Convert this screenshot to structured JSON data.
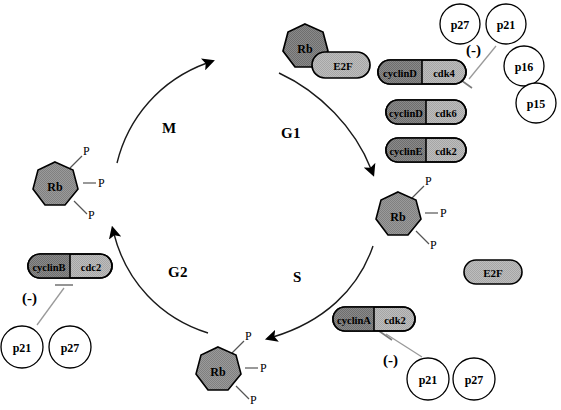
{
  "diagram": {
    "phases": [
      {
        "id": "m",
        "label": "M",
        "x": 162,
        "y": 120
      },
      {
        "id": "g1",
        "label": "G1",
        "x": 281,
        "y": 125
      },
      {
        "id": "g2",
        "label": "G2",
        "x": 168,
        "y": 264
      },
      {
        "id": "s",
        "label": "S",
        "x": 293,
        "y": 269
      }
    ],
    "colors": {
      "rb_fill": "#808080",
      "e2f_fill": "#a8a8a8",
      "cyclin_fill": "#8c8c8c",
      "cdk_fill": "#b0b0b0",
      "stroke": "#000000",
      "inhibitor_line": "#9a9a9a",
      "background": "#ffffff"
    },
    "rb_e2f_complex": {
      "rb_label": "Rb",
      "e2f_label": "E2F",
      "x": 305,
      "y": 44
    },
    "free_e2f": {
      "label": "E2F",
      "x": 492,
      "y": 272
    },
    "phospho_rb": [
      {
        "id": "rb-m-phase",
        "label": "Rb",
        "x": 55,
        "y": 186,
        "phosphates": [
          "P",
          "P",
          "P"
        ]
      },
      {
        "id": "rb-s-phase",
        "label": "Rb",
        "x": 398,
        "y": 216,
        "phosphates": [
          "P",
          "P",
          "P"
        ]
      },
      {
        "id": "rb-g2-phase",
        "label": "Rb",
        "x": 218,
        "y": 371,
        "phosphates": [
          "P",
          "P",
          "P"
        ]
      }
    ],
    "phosphate_label": "P",
    "complexes": [
      {
        "id": "cyclind-cdk4",
        "cyclin": "cyclinD",
        "kinase": "cdk4",
        "x": 378,
        "y": 67,
        "w": 88,
        "h": 24
      },
      {
        "id": "cyclind-cdk6",
        "cyclin": "cyclinD",
        "kinase": "cdk6",
        "x": 386,
        "y": 107,
        "w": 80,
        "h": 24
      },
      {
        "id": "cycline-cdk2",
        "cyclin": "cyclinE",
        "kinase": "cdk2",
        "x": 386,
        "y": 145,
        "w": 80,
        "h": 24
      },
      {
        "id": "cyclinb-cdc2",
        "cyclin": "cyclinB",
        "kinase": "cdc2",
        "x": 28,
        "y": 254,
        "w": 84,
        "h": 24
      },
      {
        "id": "cyclina-cdk2",
        "cyclin": "cyclinA",
        "kinase": "cdk2",
        "x": 333,
        "y": 307,
        "w": 80,
        "h": 24
      }
    ],
    "inhibitors": [
      {
        "id": "p27-top",
        "label": "p27",
        "cx": 460,
        "cy": 24,
        "r": 20
      },
      {
        "id": "p21-top",
        "label": "p21",
        "cx": 506,
        "cy": 24,
        "r": 20
      },
      {
        "id": "p16-top",
        "label": "p16",
        "cx": 524,
        "cy": 66,
        "r": 20
      },
      {
        "id": "p15-top",
        "label": "p15",
        "cx": 536,
        "cy": 103,
        "r": 20
      },
      {
        "id": "p21-left",
        "label": "p21",
        "cx": 22,
        "cy": 347,
        "r": 21
      },
      {
        "id": "p27-left",
        "label": "p27",
        "cx": 70,
        "cy": 347,
        "r": 21
      },
      {
        "id": "p21-bottom",
        "label": "p21",
        "cx": 428,
        "cy": 379,
        "r": 21
      },
      {
        "id": "p27-bottom",
        "label": "p27",
        "cx": 474,
        "cy": 379,
        "r": 21
      }
    ],
    "inhibition_marks": [
      {
        "id": "minus-top",
        "label": "(-)",
        "x": 466,
        "y": 42
      },
      {
        "id": "minus-left",
        "label": "(-)",
        "x": 22,
        "y": 290
      },
      {
        "id": "minus-bottom",
        "label": "(-)",
        "x": 383,
        "y": 352
      }
    ]
  }
}
